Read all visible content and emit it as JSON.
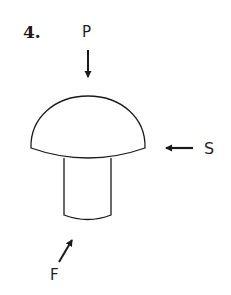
{
  "problem": {
    "number": "4."
  },
  "forces": {
    "p": {
      "label": "P",
      "direction": "down"
    },
    "s": {
      "label": "S",
      "direction": "left"
    },
    "f": {
      "label": "F",
      "direction": "up-right"
    }
  },
  "shape": {
    "name": "mushroom-shaped body",
    "parts": [
      "dome-cap",
      "cylindrical-stem"
    ]
  },
  "colors": {
    "stroke": "#1a1a1a",
    "background": "#ffffff"
  }
}
